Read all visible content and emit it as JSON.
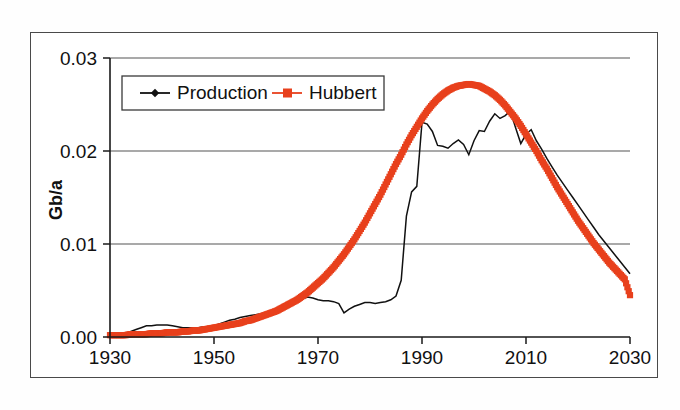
{
  "figure": {
    "name": "production-vs-hubbert-curve",
    "frame_color": "#4a4a4a",
    "background": "#ffffff"
  },
  "chart_data": {
    "type": "line",
    "title": "",
    "subtitle": "",
    "xlabel": "",
    "ylabel": "Gb/a",
    "xlim": [
      1930,
      2030
    ],
    "ylim": [
      0.0,
      0.03
    ],
    "xticks": [
      1930,
      1950,
      1970,
      1990,
      2010,
      2030
    ],
    "xtick_labels": [
      "1930",
      "1950",
      "1970",
      "1990",
      "2010",
      "2030"
    ],
    "yticks": [
      0.0,
      0.01,
      0.02,
      0.03
    ],
    "ytick_labels": [
      "0.00",
      "0.01",
      "0.02",
      "0.03"
    ],
    "grid": "horizontal",
    "legend_position": "upper-left-inside",
    "series": [
      {
        "name": "Production",
        "color": "#111111",
        "marker": "diamond",
        "line_style": "solid",
        "x": [
          1930,
          1931,
          1932,
          1933,
          1934,
          1935,
          1936,
          1937,
          1938,
          1939,
          1940,
          1941,
          1942,
          1943,
          1944,
          1945,
          1946,
          1947,
          1948,
          1949,
          1950,
          1951,
          1952,
          1953,
          1954,
          1955,
          1956,
          1957,
          1958,
          1959,
          1960,
          1961,
          1962,
          1963,
          1964,
          1965,
          1966,
          1967,
          1968,
          1969,
          1970,
          1971,
          1972,
          1973,
          1974,
          1975,
          1976,
          1977,
          1978,
          1979,
          1980,
          1981,
          1982,
          1983,
          1984,
          1985,
          1986,
          1987,
          1988,
          1989,
          1990,
          1991,
          1992,
          1993,
          1994,
          1995,
          1996,
          1997,
          1998,
          1999,
          2000,
          2001,
          2002,
          2003,
          2004,
          2005,
          2006,
          2007,
          2008,
          2009,
          2010,
          2011,
          2012,
          2013,
          2014,
          2015,
          2016,
          2017,
          2018,
          2019,
          2020,
          2021,
          2022,
          2023,
          2024,
          2025,
          2026,
          2027,
          2028,
          2029,
          2030
        ],
        "y": [
          0.0002,
          0.0002,
          0.0003,
          0.0004,
          0.0006,
          0.0008,
          0.001,
          0.0012,
          0.0012,
          0.0013,
          0.0013,
          0.0013,
          0.0012,
          0.0011,
          0.001,
          0.001,
          0.001,
          0.001,
          0.0011,
          0.0011,
          0.0012,
          0.0014,
          0.0016,
          0.0018,
          0.0019,
          0.0021,
          0.0022,
          0.0023,
          0.0024,
          0.0025,
          0.0026,
          0.0027,
          0.0028,
          0.0029,
          0.0031,
          0.0034,
          0.0038,
          0.0041,
          0.0043,
          0.0042,
          0.004,
          0.0039,
          0.0039,
          0.0038,
          0.0036,
          0.0026,
          0.003,
          0.0033,
          0.0035,
          0.0037,
          0.0037,
          0.0036,
          0.0037,
          0.0038,
          0.004,
          0.0044,
          0.0061,
          0.013,
          0.0156,
          0.0162,
          0.0231,
          0.0229,
          0.0221,
          0.0206,
          0.0205,
          0.0203,
          0.0208,
          0.0212,
          0.0207,
          0.0196,
          0.0211,
          0.0222,
          0.0221,
          0.0232,
          0.024,
          0.0235,
          0.0238,
          0.0243,
          0.0225,
          0.0208,
          0.0218,
          0.0223,
          0.0211,
          0.0202,
          0.0192,
          0.0183,
          0.0174,
          0.0166,
          0.0158,
          0.015,
          0.0142,
          0.0134,
          0.0126,
          0.0118,
          0.011,
          0.0103,
          0.0096,
          0.0089,
          0.0082,
          0.0075,
          0.0068
        ]
      },
      {
        "name": "Hubbert",
        "color": "#e8401c",
        "marker": "square",
        "line_style": "solid",
        "x": [
          1930,
          1931,
          1932,
          1933,
          1934,
          1935,
          1936,
          1937,
          1938,
          1939,
          1940,
          1941,
          1942,
          1943,
          1944,
          1945,
          1946,
          1947,
          1948,
          1949,
          1950,
          1951,
          1952,
          1953,
          1954,
          1955,
          1956,
          1957,
          1958,
          1959,
          1960,
          1961,
          1962,
          1963,
          1964,
          1965,
          1966,
          1967,
          1968,
          1969,
          1970,
          1971,
          1972,
          1973,
          1974,
          1975,
          1976,
          1977,
          1978,
          1979,
          1980,
          1981,
          1982,
          1983,
          1984,
          1985,
          1986,
          1987,
          1988,
          1989,
          1990,
          1991,
          1992,
          1993,
          1994,
          1995,
          1996,
          1997,
          1998,
          1999,
          2000,
          2001,
          2002,
          2003,
          2004,
          2005,
          2006,
          2007,
          2008,
          2009,
          2010,
          2011,
          2012,
          2013,
          2014,
          2015,
          2016,
          2017,
          2018,
          2019,
          2020,
          2021,
          2022,
          2023,
          2024,
          2025,
          2026,
          2027,
          2028,
          2029,
          2030
        ],
        "y": [
          0.0002,
          0.0002,
          0.0002,
          0.0002,
          0.0003,
          0.0003,
          0.0003,
          0.0003,
          0.0004,
          0.0004,
          0.0004,
          0.0005,
          0.0005,
          0.0005,
          0.0006,
          0.0006,
          0.0007,
          0.0007,
          0.0008,
          0.0009,
          0.001,
          0.0011,
          0.0012,
          0.0013,
          0.0014,
          0.0015,
          0.0017,
          0.0018,
          0.002,
          0.0022,
          0.0024,
          0.0026,
          0.0028,
          0.0031,
          0.0034,
          0.0037,
          0.004,
          0.0044,
          0.0048,
          0.0053,
          0.0058,
          0.0063,
          0.0069,
          0.0075,
          0.0082,
          0.0089,
          0.0097,
          0.0105,
          0.0114,
          0.0123,
          0.0133,
          0.0143,
          0.0153,
          0.0164,
          0.0175,
          0.0186,
          0.0196,
          0.0207,
          0.0217,
          0.0226,
          0.0235,
          0.0243,
          0.025,
          0.0256,
          0.0261,
          0.0265,
          0.0268,
          0.027,
          0.0271,
          0.0272,
          0.0271,
          0.027,
          0.0267,
          0.0264,
          0.026,
          0.0255,
          0.0249,
          0.0242,
          0.0235,
          0.0227,
          0.0218,
          0.0209,
          0.02,
          0.019,
          0.0181,
          0.0171,
          0.0161,
          0.0152,
          0.0143,
          0.0134,
          0.0125,
          0.0117,
          0.0109,
          0.0101,
          0.0094,
          0.0087,
          0.008,
          0.0074,
          0.0068,
          0.0062,
          0.0045
        ]
      }
    ],
    "annotations": []
  },
  "legend": {
    "entries": [
      {
        "label": "Production",
        "color": "#111111",
        "marker": "diamond"
      },
      {
        "label": "Hubbert",
        "color": "#e8401c",
        "marker": "square"
      }
    ]
  },
  "axes": {
    "y_title": "Gb/a"
  }
}
